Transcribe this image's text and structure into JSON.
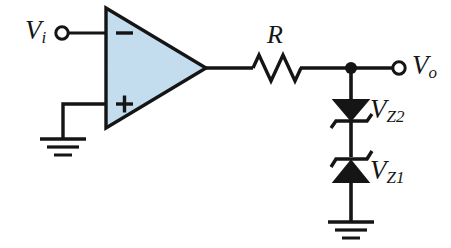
{
  "diagram": {
    "type": "electronic-circuit-schematic",
    "background_color": "#ffffff",
    "line_color": "#151515",
    "opamp_fill_color": "#c3ddef",
    "labels": {
      "input": {
        "symbol": "V",
        "subscript": "i",
        "text": "Vi"
      },
      "output": {
        "symbol": "V",
        "subscript": "o",
        "text": "Vo"
      },
      "resistor": {
        "text": "R"
      },
      "zener_upper": {
        "symbol": "V",
        "subscript": "Z2",
        "text": "VZ2"
      },
      "zener_lower": {
        "symbol": "V",
        "subscript": "Z1",
        "text": "VZ1"
      },
      "opamp_inverting": "−",
      "opamp_noninverting": "+"
    },
    "components": [
      {
        "name": "input-terminal",
        "label": "Vi",
        "kind": "open-terminal"
      },
      {
        "name": "operational-amplifier",
        "label": "",
        "kind": "opamp-triangle"
      },
      {
        "name": "inverting-input",
        "label": "−",
        "kind": "pin"
      },
      {
        "name": "noninverting-input",
        "label": "+",
        "kind": "pin"
      },
      {
        "name": "ground-opamp",
        "label": "",
        "kind": "ground-symbol"
      },
      {
        "name": "resistor",
        "label": "R",
        "kind": "resistor-zigzag"
      },
      {
        "name": "output-node",
        "label": "",
        "kind": "junction-dot"
      },
      {
        "name": "output-terminal",
        "label": "Vo",
        "kind": "open-terminal"
      },
      {
        "name": "zener-diode-upper",
        "label": "VZ2",
        "kind": "zener-diode"
      },
      {
        "name": "zener-diode-lower",
        "label": "VZ1",
        "kind": "zener-diode"
      },
      {
        "name": "ground-zener",
        "label": "",
        "kind": "ground-symbol"
      }
    ]
  }
}
